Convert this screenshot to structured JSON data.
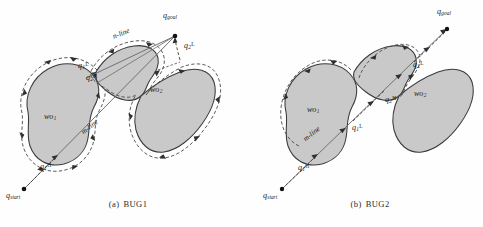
{
  "figure": {
    "panels": [
      {
        "id": "bug1",
        "caption_index": "(a)",
        "caption_label": "BUG1",
        "obstacles": [
          {
            "name": "wo1",
            "label": "wo",
            "sub": "1"
          },
          {
            "name": "wo2",
            "label": "wo",
            "sub": "2"
          }
        ],
        "lines": [
          {
            "name": "m-line",
            "label": "m-line"
          },
          {
            "name": "n-line",
            "label": "n-line"
          }
        ],
        "points": [
          {
            "name": "q-start",
            "base": "q",
            "sub": "start",
            "sup": ""
          },
          {
            "name": "q-goal",
            "base": "q",
            "sub": "goal",
            "sup": ""
          },
          {
            "name": "q1-hit",
            "base": "q",
            "sub": "1",
            "sup": "H"
          },
          {
            "name": "q1-leave",
            "base": "q",
            "sub": "1",
            "sup": "L"
          },
          {
            "name": "q2-hit",
            "base": "q",
            "sub": "2",
            "sup": "H"
          },
          {
            "name": "q2-leave",
            "base": "q",
            "sub": "2",
            "sup": "L"
          }
        ]
      },
      {
        "id": "bug2",
        "caption_index": "(b)",
        "caption_label": "BUG2",
        "obstacles": [
          {
            "name": "wo1",
            "label": "wo",
            "sub": "1"
          },
          {
            "name": "wo2",
            "label": "wo",
            "sub": "2"
          }
        ],
        "lines": [
          {
            "name": "m-line",
            "label": "m-line"
          }
        ],
        "points": [
          {
            "name": "q-start",
            "base": "q",
            "sub": "start",
            "sup": ""
          },
          {
            "name": "q-goal",
            "base": "q",
            "sub": "goal",
            "sup": ""
          },
          {
            "name": "q1-hit",
            "base": "q",
            "sub": "1",
            "sup": "H"
          },
          {
            "name": "q1-leave",
            "base": "q",
            "sub": "1",
            "sup": "L"
          },
          {
            "name": "q2-hit",
            "base": "q",
            "sub": "2",
            "sup": "H"
          },
          {
            "name": "q2-leave",
            "base": "q",
            "sub": "2",
            "sup": "L"
          }
        ]
      }
    ],
    "labels": {
      "a_caption_index": "(a)",
      "a_caption_label": "BUG1",
      "b_caption_index": "(b)",
      "b_caption_label": "BUG2",
      "q": "q",
      "start_sub": "start",
      "goal_sub": "goal",
      "one": "1",
      "two": "2",
      "hit_sup": "H",
      "leave_sup": "L",
      "wo": "wo",
      "m_line": "m-line",
      "n_line": "n-line"
    },
    "colors": {
      "obstacle_fill": "#c9c9c9",
      "obstacle_stroke": "#3a3a3a",
      "path_dashed": "#4a4a4a",
      "straight_line": "#6b6b6b",
      "text": "#1a1a1a",
      "background": "#ffffff"
    }
  }
}
